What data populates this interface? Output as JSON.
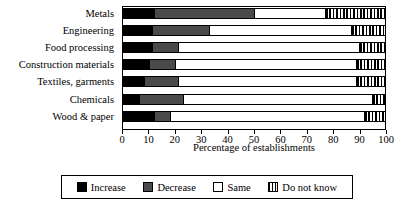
{
  "chart_data": {
    "type": "bar",
    "orientation": "horizontal",
    "stacked": true,
    "stack_mode": "percent",
    "title": "",
    "xlabel": "Percentage of establishments",
    "ylabel": "",
    "xlim": [
      0,
      100
    ],
    "xticks": [
      0,
      10,
      20,
      30,
      40,
      50,
      60,
      70,
      80,
      90,
      100
    ],
    "xtick_labels": [
      "0",
      "10",
      "20",
      "30",
      "40",
      "50",
      "60",
      "70",
      "80",
      "90",
      "100"
    ],
    "grid": false,
    "legend_position": "bottom",
    "categories": [
      "Metals",
      "Engineering",
      "Food processing",
      "Construction materials",
      "Textiles, garments",
      "Chemicals",
      "Wood & paper"
    ],
    "series": [
      {
        "name": "Increase",
        "color": "#000000",
        "pattern": "solid",
        "values": [
          12,
          11,
          11,
          10,
          8,
          6,
          12
        ]
      },
      {
        "name": "Decrease",
        "color": "#4a4a4a",
        "pattern": "solid",
        "values": [
          38,
          22,
          10,
          10,
          13,
          17,
          6
        ]
      },
      {
        "name": "Same",
        "color": "#ffffff",
        "pattern": "solid",
        "values": [
          27,
          54,
          69,
          69,
          68,
          72,
          74
        ]
      },
      {
        "name": "Do not know",
        "color": "#000000",
        "pattern": "vertical-hatch",
        "values": [
          23,
          13,
          10,
          11,
          11,
          5,
          8
        ]
      }
    ]
  },
  "legend": {
    "items": [
      {
        "label": "Increase",
        "swatch": "increase"
      },
      {
        "label": "Decrease",
        "swatch": "decrease"
      },
      {
        "label": "Same",
        "swatch": "same"
      },
      {
        "label": "Do not know",
        "swatch": "dontknow"
      }
    ]
  }
}
